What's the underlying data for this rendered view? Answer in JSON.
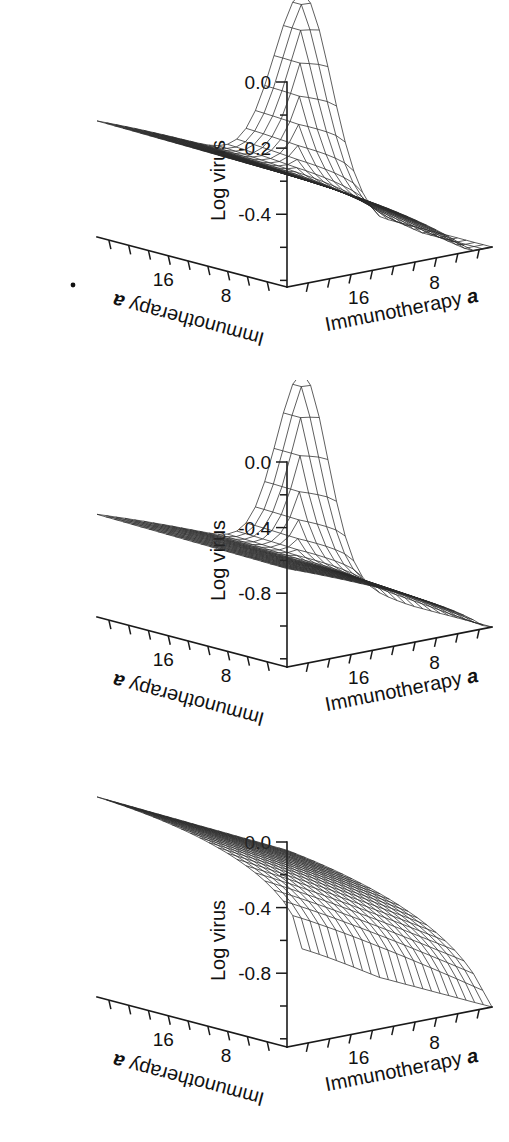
{
  "figure": {
    "background": "#ffffff",
    "ink": "#1a1a1a",
    "panel_count": 3
  },
  "panels": [
    {
      "id": "panel-a",
      "zaxis": {
        "label": "Log virus",
        "ticklabels": [
          "0.0",
          "-0.2",
          "-0.4"
        ],
        "tickvalues": [
          0.0,
          -0.2,
          -0.4
        ],
        "range": [
          -0.62,
          0.0
        ]
      },
      "xaxis": {
        "label": "Immunotherapy",
        "label_italic": "a",
        "ticklabels": [
          "8",
          "16"
        ],
        "tickvalues": [
          8,
          16
        ]
      },
      "yaxis": {
        "label": "Immunotherapy",
        "label_italic": "a",
        "ticklabels": [
          "16",
          "8"
        ],
        "tickvalues": [
          16,
          8
        ]
      },
      "speck": {
        "visible": true,
        "x": 73,
        "y": 285
      }
    },
    {
      "id": "panel-b",
      "zaxis": {
        "label": "Log virus",
        "ticklabels": [
          "0.0",
          "-0.4",
          "-0.8"
        ],
        "tickvalues": [
          0.0,
          -0.4,
          -0.8
        ],
        "range": [
          -1.25,
          0.0
        ]
      },
      "xaxis": {
        "label": "Immunotherapy",
        "label_italic": "a",
        "ticklabels": [
          "8",
          "16"
        ],
        "tickvalues": [
          8,
          16
        ]
      },
      "yaxis": {
        "label": "Immunotherapy",
        "label_italic": "a",
        "ticklabels": [
          "16",
          "8"
        ],
        "tickvalues": [
          16,
          8
        ]
      },
      "speck": {
        "visible": false
      }
    },
    {
      "id": "panel-c",
      "zaxis": {
        "label": "Log virus",
        "ticklabels": [
          "0.0",
          "-0.4",
          "-0.8"
        ],
        "tickvalues": [
          0.0,
          -0.4,
          -0.8
        ],
        "range": [
          -1.25,
          0.0
        ]
      },
      "xaxis": {
        "label": "Immunotherapy",
        "label_italic": "a",
        "ticklabels": [
          "8",
          "16"
        ],
        "tickvalues": [
          8,
          16
        ]
      },
      "yaxis": {
        "label": "Immunotherapy",
        "label_italic": "a",
        "ticklabels": [
          "16",
          "8"
        ],
        "tickvalues": [
          16,
          8
        ]
      },
      "speck": {
        "visible": false
      }
    }
  ],
  "chart_data": [
    {
      "type": "surface",
      "panel": "panel-a",
      "title": "",
      "xlabel": "Immunotherapy a",
      "ylabel": "Immunotherapy a",
      "zlabel": "Log virus",
      "xlim": [
        0,
        20
      ],
      "ylim": [
        0,
        20
      ],
      "zlim": [
        -0.62,
        0.0
      ],
      "grid": false,
      "legend": "none",
      "nx": 22,
      "ny": 22,
      "surface_model": {
        "description": "Log virus rises to a sharp ridge peak at the far back corner (high x, high y) and falls away toward both front edges; the left/back plateau sits near -0.28 and the front-right corner drops to about -0.60.",
        "plateau_z": -0.28,
        "peak_z": 0.0,
        "front_min_z": -0.6,
        "peak_corner": "back",
        "ridge_sharpness": 0.62
      },
      "z_profile_back_edge": [
        -0.28,
        -0.28,
        -0.28,
        -0.27,
        -0.27,
        -0.26,
        -0.26,
        -0.25,
        -0.24,
        -0.23,
        -0.22,
        -0.2,
        -0.18,
        -0.16,
        -0.13,
        -0.1,
        -0.07,
        -0.04,
        -0.02,
        -0.01,
        0.0,
        0.0
      ],
      "z_profile_front_edge": [
        -0.3,
        -0.31,
        -0.32,
        -0.34,
        -0.36,
        -0.38,
        -0.4,
        -0.42,
        -0.44,
        -0.46,
        -0.48,
        -0.5,
        -0.52,
        -0.53,
        -0.55,
        -0.56,
        -0.57,
        -0.58,
        -0.59,
        -0.59,
        -0.6,
        -0.6
      ]
    },
    {
      "type": "surface",
      "panel": "panel-b",
      "title": "",
      "xlabel": "Immunotherapy a",
      "ylabel": "Immunotherapy a",
      "zlabel": "Log virus",
      "xlim": [
        0,
        20
      ],
      "ylim": [
        0,
        20
      ],
      "zlim": [
        -1.25,
        0.0
      ],
      "grid": false,
      "legend": "none",
      "nx": 22,
      "ny": 22,
      "surface_model": {
        "description": "Log virus forms a narrow spike at the back corner rising to 0.0; the left plateau sits near -0.65 and the front-right corner falls to roughly -1.20.",
        "plateau_z": -0.65,
        "peak_z": 0.0,
        "front_min_z": -1.2,
        "peak_corner": "back",
        "ridge_sharpness": 0.85
      },
      "z_profile_back_edge": [
        -0.65,
        -0.65,
        -0.64,
        -0.64,
        -0.63,
        -0.62,
        -0.61,
        -0.59,
        -0.57,
        -0.55,
        -0.52,
        -0.48,
        -0.44,
        -0.39,
        -0.33,
        -0.27,
        -0.2,
        -0.13,
        -0.07,
        -0.03,
        -0.01,
        0.0
      ],
      "z_profile_front_edge": [
        -0.68,
        -0.7,
        -0.73,
        -0.76,
        -0.8,
        -0.84,
        -0.88,
        -0.92,
        -0.96,
        -1.0,
        -1.03,
        -1.06,
        -1.09,
        -1.11,
        -1.13,
        -1.15,
        -1.16,
        -1.17,
        -1.18,
        -1.19,
        -1.2,
        -1.2
      ]
    },
    {
      "type": "surface",
      "panel": "panel-c",
      "title": "",
      "xlabel": "Immunotherapy a",
      "ylabel": "Immunotherapy a",
      "zlabel": "Log virus",
      "xlim": [
        0,
        20
      ],
      "ylim": [
        0,
        20
      ],
      "zlim": [
        -1.25,
        0.0
      ],
      "grid": false,
      "legend": "none",
      "nx": 22,
      "ny": 22,
      "surface_model": {
        "description": "Log virus is high and nearly flat along the whole back edge near -0.05, then falls smoothly and steeply toward the front, reaching about -1.20 at the front-right corner. Broad rounded ridge, no spike.",
        "plateau_z": -0.05,
        "peak_z": -0.03,
        "front_min_z": -1.2,
        "peak_corner": "back-edge",
        "ridge_sharpness": 0.05
      },
      "z_profile_back_edge": [
        -0.05,
        -0.05,
        -0.05,
        -0.05,
        -0.04,
        -0.04,
        -0.04,
        -0.04,
        -0.04,
        -0.03,
        -0.03,
        -0.03,
        -0.03,
        -0.03,
        -0.03,
        -0.03,
        -0.03,
        -0.03,
        -0.03,
        -0.03,
        -0.03,
        -0.03
      ],
      "z_profile_front_edge": [
        -0.7,
        -0.75,
        -0.8,
        -0.85,
        -0.89,
        -0.93,
        -0.97,
        -1.0,
        -1.03,
        -1.06,
        -1.08,
        -1.1,
        -1.12,
        -1.14,
        -1.15,
        -1.16,
        -1.17,
        -1.18,
        -1.19,
        -1.19,
        -1.2,
        -1.2
      ]
    }
  ]
}
